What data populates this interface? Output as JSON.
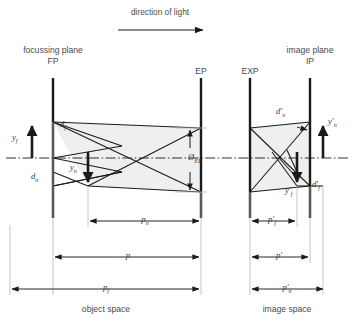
{
  "figure": {
    "title": "direction of light",
    "type": "optical-ray-diagram",
    "domain": "depth of field / depth of focus geometry",
    "object_space_label": "object space",
    "image_space_label": "image space"
  },
  "planes": [
    {
      "id": "FP",
      "name_line1": "focussing plane",
      "name_line2": "FP",
      "x": 53,
      "top": 78,
      "bottom": 218
    },
    {
      "id": "EP",
      "name_line1": "",
      "name_line2": "EP",
      "x": 201,
      "top": 78,
      "bottom": 218
    },
    {
      "id": "EXP",
      "name_line1": "",
      "name_line2": "EXP",
      "x": 250,
      "top": 78,
      "bottom": 218
    },
    {
      "id": "IP",
      "name_line1": "image plane",
      "name_line2": "IP",
      "x": 310,
      "top": 78,
      "bottom": 218
    }
  ],
  "axis": {
    "label": "optical axis",
    "y": 158,
    "style": "dash-dot"
  },
  "arrow_header": {
    "label": "direction of light",
    "x1": 118,
    "x2": 205,
    "y": 30
  },
  "object_space": {
    "heights": [
      {
        "id": "y_f",
        "base": "y",
        "sub": "f",
        "prime": false,
        "direction": "up",
        "x": 32,
        "from_y": 158,
        "to_y": 122
      },
      {
        "id": "y_n",
        "base": "y",
        "sub": "n",
        "prime": false,
        "direction": "down",
        "x": 88,
        "from_y": 158,
        "to_y": 186
      }
    ],
    "blur_diameters": [
      {
        "id": "d_f",
        "base": "d",
        "sub": "f",
        "prime": false,
        "x": 61,
        "y": 124
      },
      {
        "id": "d_n",
        "base": "d",
        "sub": "n",
        "prime": false,
        "x": 34,
        "y": 176
      }
    ],
    "distances": [
      {
        "id": "p_n",
        "base": "p",
        "sub": "n",
        "prime": false,
        "x1": 88,
        "x2": 202,
        "y": 221,
        "label_x": 145
      },
      {
        "id": "p",
        "base": "p",
        "sub": "",
        "prime": false,
        "x1": 53,
        "x2": 202,
        "y": 257,
        "label_x": 128
      },
      {
        "id": "p_f",
        "base": "p",
        "sub": "f",
        "prime": false,
        "x1": 10,
        "x2": 202,
        "y": 289,
        "label_x": 106
      }
    ]
  },
  "image_space": {
    "heights": [
      {
        "id": "y_n_prime",
        "base": "y",
        "sub": "n",
        "prime": true,
        "direction": "up",
        "x": 323,
        "from_y": 158,
        "to_y": 122
      },
      {
        "id": "y_f_prime",
        "base": "y",
        "sub": "f",
        "prime": true,
        "direction": "down",
        "x": 297,
        "from_y": 158,
        "to_y": 186
      }
    ],
    "blur_diameters": [
      {
        "id": "d_n_prime",
        "base": "d",
        "sub": "n",
        "prime": true,
        "x": 281,
        "y": 115
      },
      {
        "id": "d_f_prime",
        "base": "d",
        "sub": "f",
        "prime": true,
        "x": 312,
        "y": 186
      }
    ],
    "distances": [
      {
        "id": "p_f_prime",
        "base": "p",
        "sub": "f",
        "prime": true,
        "x1": 250,
        "x2": 297,
        "y": 221,
        "label_x": 272
      },
      {
        "id": "p_prime",
        "base": "p",
        "sub": "",
        "prime": true,
        "x1": 250,
        "x2": 310,
        "y": 257,
        "label_x": 279
      },
      {
        "id": "p_n_prime",
        "base": "p",
        "sub": "n",
        "prime": true,
        "x1": 250,
        "x2": 325,
        "y": 289,
        "label_x": 287
      }
    ]
  },
  "aperture": {
    "id": "phi_EP",
    "glyph": "Ø",
    "sub": "EP",
    "x": 196,
    "y": 160,
    "top_y": 128,
    "bottom_y": 192
  },
  "labels": {
    "fp_line1": "focussing plane",
    "fp_line2": "FP",
    "ip_line1": "image plane",
    "ip_line2": "IP",
    "ep": "EP",
    "exp": "EXP",
    "direction_of_light": "direction of light",
    "object_space": "object space",
    "image_space": "image space",
    "y_f": "y",
    "y_f_sub": "f",
    "y_n": "y",
    "y_n_sub": "n",
    "d_f": "d",
    "d_f_sub": "f",
    "d_n": "d",
    "d_n_sub": "n",
    "p_n": "p",
    "p_n_sub": "n",
    "p": "p",
    "p_f": "p",
    "p_f_sub": "f",
    "phi": "Ø",
    "phi_sub": "EP",
    "d_n_prime": "d",
    "d_n_prime_sub": "n",
    "d_f_prime": "d",
    "d_f_prime_sub": "f",
    "y_n_prime": "y",
    "y_n_prime_sub": "n",
    "y_f_prime": "y",
    "y_f_prime_sub": "f",
    "p_f_prime": "p",
    "p_f_prime_sub": "f",
    "p_prime": "p",
    "p_n_prime": "p",
    "p_n_prime_sub": "n",
    "prime_mark": "′"
  },
  "colors": {
    "ink": "#1a1a1a",
    "text": "#4a4a4a",
    "thin_line": "#6e6e6e",
    "extension_line": "#b9b9b9",
    "shade_fill": "#efefef",
    "background": "#ffffff"
  }
}
